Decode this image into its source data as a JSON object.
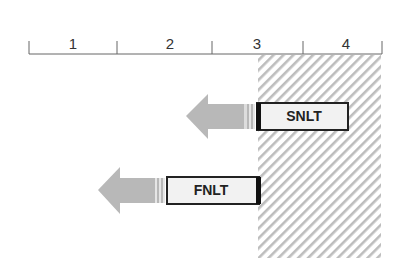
{
  "axis": {
    "ticks_x": [
      29,
      117,
      212,
      303,
      382
    ],
    "segments": [
      {
        "label": "1",
        "center": 73
      },
      {
        "label": "2",
        "center": 165
      },
      {
        "label": "3",
        "center": 258
      },
      {
        "label": "4",
        "center": 343
      }
    ]
  },
  "hatched_region": {
    "x": 258,
    "y": 55,
    "width": 123,
    "height": 203,
    "color": "#bdbdbd"
  },
  "bars": [
    {
      "label": "SNLT",
      "box_x": 258,
      "box_y": 103,
      "box_w": 90,
      "box_h": 27,
      "arrow_tip_x": 186
    },
    {
      "label": "FNLT",
      "box_x": 166,
      "box_y": 177,
      "box_w": 94,
      "box_h": 27,
      "arrow_tip_x": 98
    }
  ]
}
